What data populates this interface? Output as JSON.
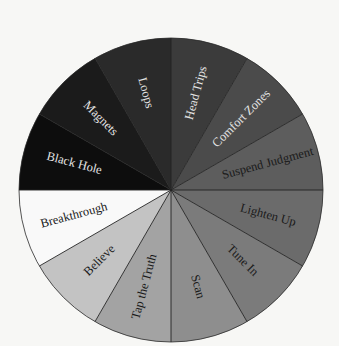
{
  "diagram": {
    "type": "wheel",
    "center": [
      171,
      190
    ],
    "radius": 152,
    "segment_angle_deg": 30,
    "start": "top, clockwise",
    "segments": [
      {
        "label": "Head Trips",
        "fill": "#3b3b3b",
        "text_color": "#e4e4e4"
      },
      {
        "label": "Comfort Zones",
        "fill": "#4b4b4b",
        "text_color": "#e4e4e4"
      },
      {
        "label": "Suspend Judgment",
        "fill": "#5d5d5d",
        "text_color": "#1a1a1a"
      },
      {
        "label": "Lighten Up",
        "fill": "#6b6b6b",
        "text_color": "#1a1a1a"
      },
      {
        "label": "Tune In",
        "fill": "#7b7b7b",
        "text_color": "#1a1a1a"
      },
      {
        "label": "Scan",
        "fill": "#8e8e8e",
        "text_color": "#1a1a1a"
      },
      {
        "label": "Tap the Truth",
        "fill": "#a3a3a3",
        "text_color": "#1a1a1a"
      },
      {
        "label": "Believe",
        "fill": "#c3c3c3",
        "text_color": "#1a1a1a"
      },
      {
        "label": "Breakthrough",
        "fill": "#f9f9f9",
        "text_color": "#1a1a1a"
      },
      {
        "label": "Black Hole",
        "fill": "#0d0d0d",
        "text_color": "#e4e4e4"
      },
      {
        "label": "Magnets",
        "fill": "#1b1b1b",
        "text_color": "#e4e4e4"
      },
      {
        "label": "Loops",
        "fill": "#2a2a2a",
        "text_color": "#e4e4e4"
      }
    ],
    "divider_color": "#222222",
    "background": "#f7f7f5"
  }
}
